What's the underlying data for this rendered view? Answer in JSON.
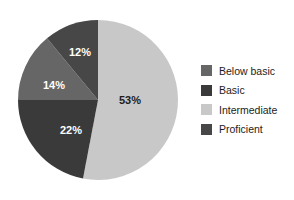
{
  "chart_data": {
    "type": "pie",
    "title": "",
    "subtitle": "",
    "xlabel": "",
    "ylabel": "",
    "grid": false,
    "legend_position": "right",
    "start_angle_deg": 0,
    "direction": "clockwise",
    "categories": [
      "Below basic",
      "Basic",
      "Intermediate",
      "Proficient"
    ],
    "values": [
      14,
      22,
      53,
      12
    ],
    "value_unit": "percent",
    "slices": [
      {
        "label": "Below basic",
        "value": 14,
        "display": "14%",
        "color": "#666666",
        "label_color": "#ffffff",
        "start_deg": 270,
        "end_deg": 320.4
      },
      {
        "label": "Basic",
        "value": 22,
        "display": "22%",
        "color": "#3a3a3a",
        "label_color": "#ffffff",
        "start_deg": 190.8,
        "end_deg": 270
      },
      {
        "label": "Intermediate",
        "value": 53,
        "display": "53%",
        "color": "#c8c8c8",
        "label_color": "#1c1c1c",
        "start_deg": 0,
        "end_deg": 190.8
      },
      {
        "label": "Proficient",
        "value": 12,
        "display": "12%",
        "color": "#474747",
        "label_color": "#ffffff",
        "start_deg": 320.4,
        "end_deg": 360
      }
    ],
    "data_labels": [
      "53%",
      "22%",
      "14%",
      "12%"
    ]
  },
  "legend": {
    "items": [
      {
        "label": "Below basic",
        "color": "#666666"
      },
      {
        "label": "Basic",
        "color": "#3a3a3a"
      },
      {
        "label": "Intermediate",
        "color": "#c8c8c8"
      },
      {
        "label": "Proficient",
        "color": "#474747"
      }
    ]
  },
  "labels": {
    "intermediate": "53%",
    "basic": "22%",
    "below_basic": "14%",
    "proficient": "12%"
  }
}
